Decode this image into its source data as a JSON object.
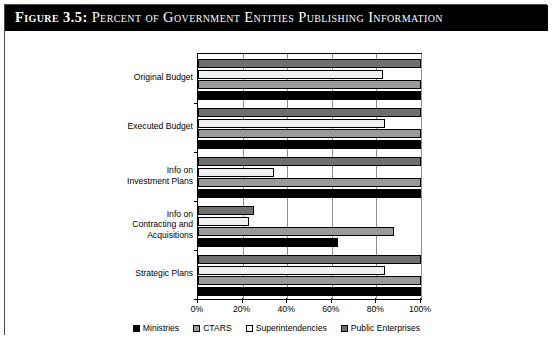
{
  "figure": {
    "label": "Figure 3.5:",
    "title": "Percent of Government Entities Publishing Information"
  },
  "chart_data": {
    "type": "bar",
    "orientation": "horizontal",
    "title": "Percent of Government Entities Publishing Information",
    "xlabel": "",
    "ylabel": "",
    "xlim": [
      0,
      100
    ],
    "xticks": [
      0,
      20,
      40,
      60,
      80,
      100
    ],
    "xtick_labels": [
      "0%",
      "20%",
      "40%",
      "60%",
      "80%",
      "100%"
    ],
    "grid": true,
    "legend_position": "bottom",
    "categories": [
      "Original Budget",
      "Executed Budget",
      "Info on Investment Plans",
      "Info on Contracting and Acquisitions",
      "Strategic Plans"
    ],
    "category_labels": [
      [
        "Original Budget"
      ],
      [
        "Executed Budget"
      ],
      [
        "Info on",
        "Investment Plans"
      ],
      [
        "Info on",
        "Contracting and",
        "Acquisitions"
      ],
      [
        "Strategic Plans"
      ]
    ],
    "series": [
      {
        "name": "Ministries",
        "color": "#000000",
        "values": [
          100,
          100,
          100,
          63,
          100
        ]
      },
      {
        "name": "CTARS",
        "color": "#9a9a9a",
        "values": [
          100,
          100,
          100,
          88,
          100
        ]
      },
      {
        "name": "Superintendencies",
        "color": "#f0f0f0",
        "values": [
          83,
          84,
          34,
          23,
          84
        ]
      },
      {
        "name": "Public Enterprises",
        "color": "#6f6f6f",
        "values": [
          100,
          100,
          100,
          25,
          100
        ]
      }
    ]
  },
  "legend": {
    "items": [
      {
        "label": "Ministries",
        "swatch": "ministries"
      },
      {
        "label": "CTARS",
        "swatch": "ctars"
      },
      {
        "label": "Superintendencies",
        "swatch": "superintendencies"
      },
      {
        "label": "Public Enterprises",
        "swatch": "public"
      }
    ]
  }
}
